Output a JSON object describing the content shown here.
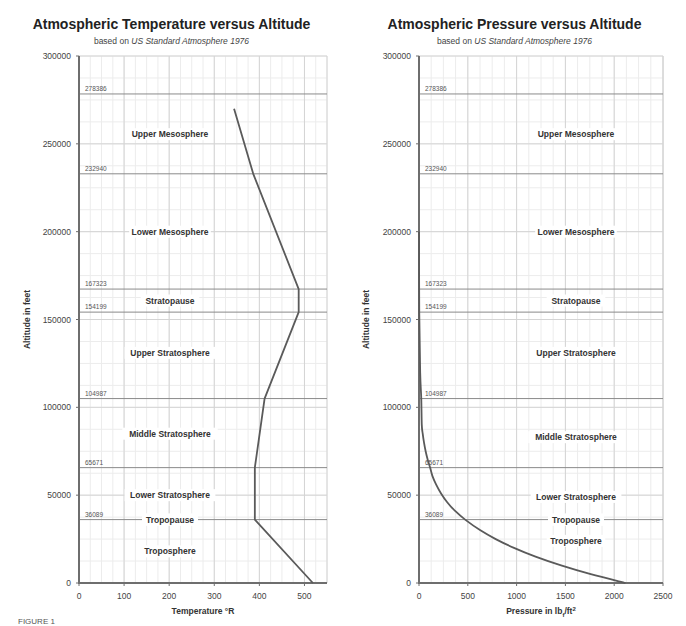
{
  "chart_data": [
    {
      "type": "line",
      "title": "Atmospheric Temperature versus Altitude",
      "subtitle_prefix": "based on ",
      "subtitle_italic": "US Standard Atmosphere 1976",
      "xlabel": "Temperature °R",
      "ylabel": "Altitude in feet",
      "xlim": [
        0,
        550
      ],
      "ylim": [
        0,
        300000
      ],
      "xticks": [
        0,
        100,
        200,
        300,
        400,
        500
      ],
      "yticks": [
        0,
        50000,
        100000,
        150000,
        200000,
        250000,
        300000
      ],
      "grid": true,
      "boundaries": [
        278386,
        232940,
        167323,
        154199,
        104987,
        65671,
        36089
      ],
      "regions": [
        {
          "label": "Upper Mesosphere",
          "altitude": 255500
        },
        {
          "label": "Lower Mesosphere",
          "altitude": 200000
        },
        {
          "label": "Stratopause",
          "altitude": 160800
        },
        {
          "label": "Upper Stratosphere",
          "altitude": 131000
        },
        {
          "label": "Middle Stratosphere",
          "altitude": 85000
        },
        {
          "label": "Lower Stratosphere",
          "altitude": 50000
        },
        {
          "label": "Tropopause",
          "altitude": 36089
        },
        {
          "label": "Troposphere",
          "altitude": 18000
        }
      ],
      "series": [
        {
          "name": "Temperature",
          "x": [
            518.7,
            389.97,
            389.97,
            411.6,
            487.2,
            487.2,
            386.4,
            343.9
          ],
          "y": [
            0,
            36089,
            65671,
            104987,
            154199,
            167323,
            232940,
            270000
          ]
        }
      ]
    },
    {
      "type": "line",
      "title": "Atmospheric Pressure versus Altitude",
      "subtitle_prefix": "based on ",
      "subtitle_italic": "US Standard Atmosphere 1976",
      "xlabel": "Pressure in lbf/ft²",
      "ylabel": "Altitude in feet",
      "xlim": [
        0,
        2500
      ],
      "ylim": [
        0,
        300000
      ],
      "xticks": [
        0,
        500,
        1000,
        1500,
        2000,
        2500
      ],
      "yticks": [
        0,
        50000,
        100000,
        150000,
        200000,
        250000,
        300000
      ],
      "grid": true,
      "boundaries": [
        278386,
        232940,
        167323,
        154199,
        104987,
        65671,
        36089
      ],
      "regions": [
        {
          "label": "Upper Mesosphere",
          "altitude": 255500
        },
        {
          "label": "Lower Mesosphere",
          "altitude": 200000
        },
        {
          "label": "Stratopause",
          "altitude": 160800
        },
        {
          "label": "Upper Stratosphere",
          "altitude": 131000
        },
        {
          "label": "Middle Stratosphere",
          "altitude": 83000
        },
        {
          "label": "Lower Stratosphere",
          "altitude": 49000
        },
        {
          "label": "Tropopause",
          "altitude": 36089
        },
        {
          "label": "Troposphere",
          "altitude": 24000
        }
      ],
      "series": [
        {
          "name": "Pressure",
          "x": [
            2116.2,
            1760,
            1456,
            1194,
            973,
            786,
            629,
            472.7,
            370,
            289,
            226,
            176,
            137,
            114.3,
            90,
            68,
            51,
            38,
            28.5,
            23.1,
            12,
            2.5,
            0.5
          ],
          "y": [
            0,
            5000,
            10000,
            15000,
            20000,
            25000,
            30000,
            36089,
            41000,
            46000,
            51000,
            56000,
            61000,
            65671,
            70000,
            75000,
            80000,
            85000,
            90000,
            104987,
            120000,
            154199,
            200000
          ]
        }
      ]
    }
  ],
  "charts": {
    "temperature": {
      "title": "Atmospheric Temperature versus Altitude",
      "subtitle_prefix": "based on ",
      "subtitle_italic": "US Standard Atmosphere 1976",
      "xlabel": "Temperature °R",
      "ylabel": "Altitude in feet"
    },
    "pressure": {
      "title": "Atmospheric Pressure versus Altitude",
      "subtitle_prefix": "based on ",
      "subtitle_italic": "US Standard Atmosphere 1976",
      "xlabel_main": "Pressure in lb",
      "xlabel_sub": "f",
      "xlabel_tail": "/ft",
      "xlabel_sup": "2",
      "ylabel": "Altitude in feet"
    }
  },
  "caption": "FIGURE 1"
}
